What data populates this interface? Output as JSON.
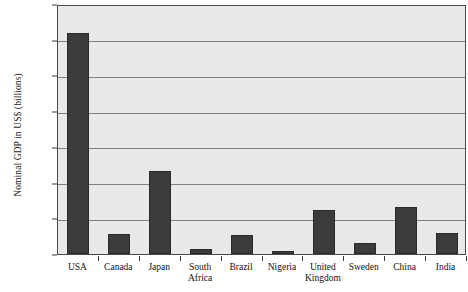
{
  "chart_data": {
    "type": "bar",
    "title": "",
    "xlabel": "",
    "ylabel": "Nominal GDP in US$ (billions)",
    "ylim": [
      0,
      14000
    ],
    "ytick_values": [
      0,
      2000,
      4000,
      6000,
      8000,
      10000,
      12000,
      14000
    ],
    "ytick_labels": [
      "0",
      "2,000",
      "4,000",
      "6,000",
      "8,000",
      "10,000",
      "12,000",
      "14,000"
    ],
    "grid": true,
    "legend": false,
    "categories": [
      "USA",
      "Canada",
      "Japan",
      "South\nAfrica",
      "Brazil",
      "Nigeria",
      "United\nKingdom",
      "Sweden",
      "China",
      "India"
    ],
    "values": [
      12400,
      1130,
      4650,
      290,
      1070,
      170,
      2450,
      600,
      2630,
      1150
    ],
    "colors": {
      "bar_fill": "#3b3b3b",
      "bar_edge": "#2a2a2a",
      "plot_background": "#e9e9e7",
      "gridline": "#808080",
      "axis": "#4a4a4a",
      "text": "#111111",
      "figure_background": "#ffffff"
    }
  }
}
